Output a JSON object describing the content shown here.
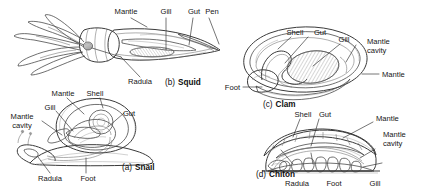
{
  "figure": {
    "background_color": "#ffffff",
    "ink_color": "#3a3a3a",
    "label_color": "#151515",
    "style": "grayscale pencil illustration with leader-line callouts"
  },
  "panels": [
    {
      "id": "snail",
      "caption_prefix": "(a)",
      "caption_name": "Snail",
      "labels": [
        {
          "name": "mantle",
          "text": "Mantle"
        },
        {
          "name": "shell",
          "text": "Shell"
        },
        {
          "name": "gill",
          "text": "Gill"
        },
        {
          "name": "gut",
          "text": "Gut"
        },
        {
          "name": "mantle-cavity-line1",
          "text": "Mantle"
        },
        {
          "name": "mantle-cavity-line2",
          "text": "cavity"
        },
        {
          "name": "radula",
          "text": "Radula"
        },
        {
          "name": "foot",
          "text": "Foot"
        }
      ]
    },
    {
      "id": "squid",
      "caption_prefix": "(b)",
      "caption_name": "Squid",
      "labels": [
        {
          "name": "mantle",
          "text": "Mantle"
        },
        {
          "name": "gill",
          "text": "Gill"
        },
        {
          "name": "gut",
          "text": "Gut"
        },
        {
          "name": "pen",
          "text": "Pen"
        },
        {
          "name": "radula",
          "text": "Radula"
        }
      ]
    },
    {
      "id": "clam",
      "caption_prefix": "(c)",
      "caption_name": "Clam",
      "labels": [
        {
          "name": "shell",
          "text": "Shell"
        },
        {
          "name": "gut",
          "text": "Gut"
        },
        {
          "name": "gill",
          "text": "Gill"
        },
        {
          "name": "mantle-cavity-line1",
          "text": "Mantle"
        },
        {
          "name": "mantle-cavity-line2",
          "text": "cavity"
        },
        {
          "name": "mantle",
          "text": "Mantle"
        },
        {
          "name": "foot",
          "text": "Foot"
        }
      ]
    },
    {
      "id": "chiton",
      "caption_prefix": "(d)",
      "caption_name": "Chiton",
      "labels": [
        {
          "name": "shell",
          "text": "Shell"
        },
        {
          "name": "gut",
          "text": "Gut"
        },
        {
          "name": "mantle",
          "text": "Mantle"
        },
        {
          "name": "mantle-cavity-line1",
          "text": "Mantle"
        },
        {
          "name": "mantle-cavity-line2",
          "text": "cavity"
        },
        {
          "name": "radula",
          "text": "Radula"
        },
        {
          "name": "foot",
          "text": "Foot"
        },
        {
          "name": "gill",
          "text": "Gill"
        }
      ]
    }
  ]
}
